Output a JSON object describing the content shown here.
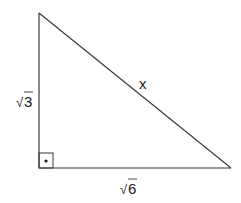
{
  "diagram": {
    "type": "right-triangle",
    "vertices": {
      "top": [
        39,
        13
      ],
      "right_angle": [
        39,
        168
      ],
      "right": [
        231,
        168
      ]
    },
    "sides": {
      "vertical_leg": {
        "label_radical": "√",
        "label_value": "3"
      },
      "horizontal_leg": {
        "label_radical": "√",
        "label_value": "6"
      },
      "hypotenuse": {
        "label": "x"
      }
    },
    "right_angle_marker": {
      "size": 15,
      "has_dot": true
    },
    "colors": {
      "stroke": "#3a3a3a",
      "text": "#1a1a1a",
      "background": "#ffffff"
    }
  }
}
